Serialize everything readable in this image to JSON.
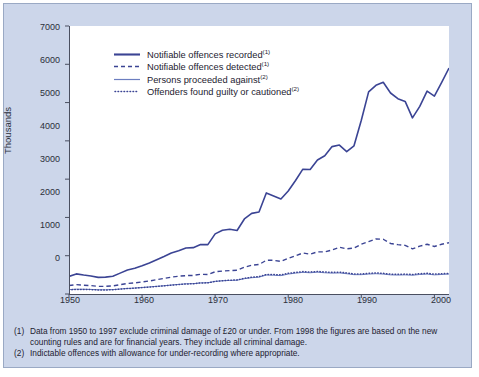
{
  "chart_data": {
    "type": "line",
    "title": "",
    "subtitle": "",
    "xlabel": "",
    "ylabel": "Thousands",
    "xlim": [
      1950,
      2002
    ],
    "ylim": [
      0,
      7000
    ],
    "yticks": [
      0,
      1000,
      2000,
      3000,
      4000,
      5000,
      6000,
      7000
    ],
    "xticks": [
      1950,
      1960,
      1970,
      1980,
      1990,
      2000
    ],
    "grid": false,
    "legend_position": "top-left-inside",
    "colors": {
      "notifiable_recorded": "#3b4494",
      "notifiable_detected": "#3b4494",
      "persons_proceeded": "#6c7ec0",
      "offenders_guilty": "#3b4494",
      "background": "#ccd6ea",
      "plot_background": "#ffffff",
      "axis": "#4a4f60",
      "border": "#9aa9c4"
    },
    "x": [
      1950,
      1951,
      1952,
      1953,
      1954,
      1955,
      1956,
      1957,
      1958,
      1959,
      1960,
      1961,
      1962,
      1963,
      1964,
      1965,
      1966,
      1967,
      1968,
      1969,
      1970,
      1971,
      1972,
      1973,
      1974,
      1975,
      1976,
      1977,
      1978,
      1979,
      1980,
      1981,
      1982,
      1983,
      1984,
      1985,
      1986,
      1987,
      1988,
      1989,
      1990,
      1991,
      1992,
      1993,
      1994,
      1995,
      1996,
      1997,
      1998,
      1999,
      2000,
      2001,
      2002
    ],
    "series": [
      {
        "name": "Notifiable offences recorded",
        "footnote": "1",
        "style": "solid-thick",
        "color": "#3b4494",
        "values": [
          460,
          525,
          495,
          470,
          435,
          440,
          465,
          545,
          625,
          675,
          740,
          810,
          895,
          980,
          1070,
          1130,
          1200,
          1210,
          1290,
          1290,
          1570,
          1665,
          1690,
          1660,
          1960,
          2105,
          2140,
          2640,
          2560,
          2480,
          2690,
          2965,
          3260,
          3250,
          3500,
          3610,
          3850,
          3890,
          3720,
          3870,
          4540,
          5280,
          5450,
          5530,
          5250,
          5100,
          5030,
          4600,
          4900,
          5300,
          5170,
          5530,
          5900
        ]
      },
      {
        "name": "Notifiable offences detected",
        "footnote": "1",
        "style": "dashed",
        "color": "#3b4494",
        "values": [
          220,
          245,
          230,
          220,
          200,
          200,
          210,
          245,
          275,
          290,
          315,
          340,
          375,
          405,
          440,
          465,
          480,
          485,
          515,
          510,
          580,
          600,
          610,
          620,
          700,
          750,
          770,
          880,
          880,
          850,
          930,
          1000,
          1070,
          1040,
          1100,
          1100,
          1150,
          1220,
          1180,
          1200,
          1300,
          1370,
          1440,
          1430,
          1320,
          1290,
          1270,
          1180,
          1250,
          1300,
          1240,
          1300,
          1340
        ]
      },
      {
        "name": "Persons proceeded against",
        "footnote": "2",
        "style": "solid-thin",
        "color": "#6c7ec0",
        "values": [
          115,
          125,
          125,
          120,
          110,
          110,
          115,
          130,
          145,
          155,
          170,
          185,
          200,
          215,
          235,
          250,
          265,
          270,
          290,
          295,
          330,
          345,
          355,
          360,
          400,
          425,
          440,
          495,
          490,
          480,
          520,
          545,
          565,
          555,
          570,
          555,
          545,
          550,
          530,
          505,
          505,
          520,
          530,
          520,
          500,
          495,
          500,
          490,
          510,
          520,
          500,
          510,
          520
        ]
      },
      {
        "name": "Offenders found guilty or cautioned",
        "footnote": "2",
        "style": "dotted",
        "color": "#3b4494",
        "values": [
          110,
          120,
          120,
          115,
          105,
          105,
          112,
          128,
          142,
          152,
          168,
          182,
          198,
          212,
          232,
          248,
          262,
          268,
          288,
          292,
          330,
          348,
          360,
          368,
          410,
          438,
          455,
          510,
          510,
          500,
          540,
          565,
          585,
          575,
          590,
          575,
          565,
          570,
          550,
          525,
          525,
          540,
          550,
          540,
          520,
          515,
          520,
          510,
          530,
          540,
          520,
          530,
          540
        ]
      }
    ]
  },
  "axis": {
    "ylabel": "Thousands",
    "ytick_labels": [
      "7000",
      "6000",
      "5000",
      "4000",
      "3000",
      "2000",
      "1000",
      "0"
    ],
    "xtick_labels": [
      "1950",
      "1960",
      "1970",
      "1980",
      "1990",
      "2000"
    ]
  },
  "legend": {
    "items": [
      {
        "label": "Notifiable offences recorded",
        "sup": "(1)",
        "swatch": "solid-thick-line-swatch"
      },
      {
        "label": "Notifiable offences detected",
        "sup": "(1)",
        "swatch": "dashed-line-swatch"
      },
      {
        "label": "Persons proceeded against",
        "sup": "(2)",
        "swatch": "solid-thin-line-swatch"
      },
      {
        "label": "Offenders found guilty or cautioned",
        "sup": "(2)",
        "swatch": "dotted-line-swatch"
      }
    ]
  },
  "footnotes": [
    {
      "marker": "(1)",
      "text": "Data from 1950 to 1997 exclude criminal damage of £20 or under. From 1998 the figures are based on the new counting rules and are for financial years. They include all criminal damage."
    },
    {
      "marker": "(2)",
      "text": "Indictable offences with allowance for under-recording where appropriate."
    }
  ]
}
